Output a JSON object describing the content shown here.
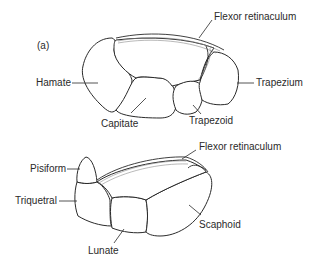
{
  "figure": {
    "panel_label": "(a)",
    "top_view": {
      "labels": {
        "flexor": "Flexor retinaculum",
        "hamate": "Hamate",
        "trapezium": "Trapezium",
        "capitate": "Capitate",
        "trapezoid": "Trapezoid"
      }
    },
    "bottom_view": {
      "labels": {
        "flexor": "Flexor retinaculum",
        "pisiform": "Pisiform",
        "triquetral": "Triquetral",
        "scaphoid": "Scaphoid",
        "lunate": "Lunate"
      }
    }
  }
}
